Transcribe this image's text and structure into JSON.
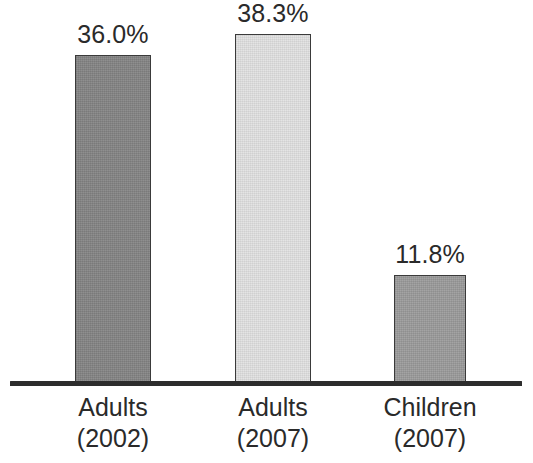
{
  "chart_data": {
    "type": "bar",
    "title": "",
    "subtitle": "",
    "xlabel": "",
    "ylabel": "",
    "grid": false,
    "legend": false,
    "legend_position": "none",
    "ylim": [
      0,
      42
    ],
    "value_suffix": "%",
    "categories": [
      "Adults (2002)",
      "Adults (2007)",
      "Children (2007)"
    ],
    "values": [
      36.0,
      38.3,
      11.8
    ],
    "bars": [
      {
        "id": "bar-adults-2002",
        "category_line1": "Adults",
        "category_line2": "(2002)",
        "value": 36.0,
        "value_label": "36.0%",
        "fill_color": "#848484",
        "border_color": "#3a3a3a"
      },
      {
        "id": "bar-adults-2007",
        "category_line1": "Adults",
        "category_line2": "(2007)",
        "value": 38.3,
        "value_label": "38.3%",
        "fill_color": "#e2e2e2",
        "border_color": "#3a3a3a"
      },
      {
        "id": "bar-children-2007",
        "category_line1": "Children",
        "category_line2": "(2007)",
        "value": 11.8,
        "value_label": "11.8%",
        "fill_color": "#9b9b9b",
        "border_color": "#3a3a3a"
      }
    ],
    "axis": {
      "baseline_color": "#2d2d2d"
    }
  }
}
